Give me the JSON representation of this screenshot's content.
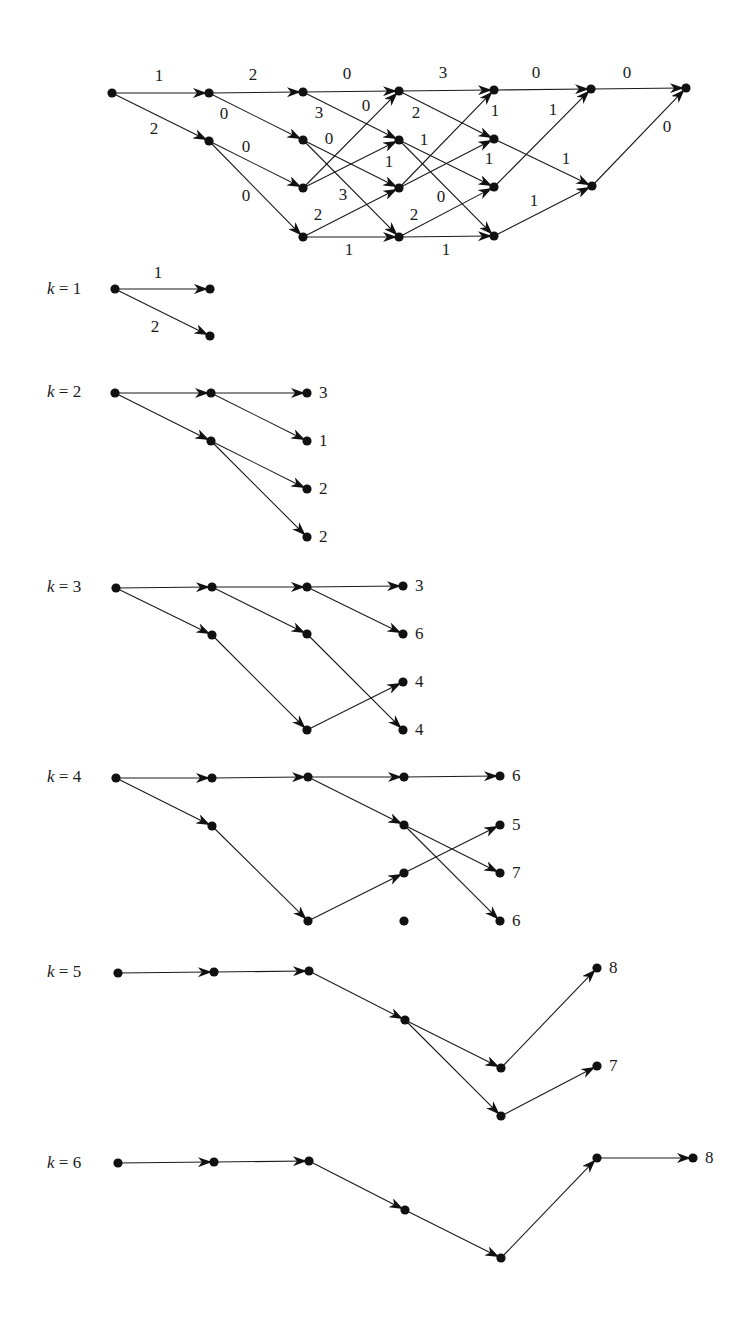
{
  "diagram": {
    "title": "",
    "colors": {
      "ink": "#111111",
      "background": "#ffffff"
    },
    "trellis": {
      "nodes": [
        {
          "id": "s",
          "x": 112,
          "y": 93
        },
        {
          "id": "a1",
          "x": 209,
          "y": 93
        },
        {
          "id": "a2",
          "x": 209,
          "y": 141
        },
        {
          "id": "b1",
          "x": 303,
          "y": 92
        },
        {
          "id": "b2",
          "x": 303,
          "y": 140
        },
        {
          "id": "b3",
          "x": 303,
          "y": 188
        },
        {
          "id": "b4",
          "x": 303,
          "y": 237
        },
        {
          "id": "c1",
          "x": 399,
          "y": 91
        },
        {
          "id": "c2",
          "x": 399,
          "y": 140
        },
        {
          "id": "c3",
          "x": 399,
          "y": 188
        },
        {
          "id": "c4",
          "x": 399,
          "y": 237
        },
        {
          "id": "d1",
          "x": 494,
          "y": 90
        },
        {
          "id": "d2",
          "x": 494,
          "y": 139
        },
        {
          "id": "d3",
          "x": 494,
          "y": 187
        },
        {
          "id": "d4",
          "x": 494,
          "y": 236
        },
        {
          "id": "e1",
          "x": 591,
          "y": 89
        },
        {
          "id": "e2",
          "x": 592,
          "y": 186
        },
        {
          "id": "t",
          "x": 686,
          "y": 88
        }
      ],
      "edges": [
        {
          "from": "s",
          "to": "a1",
          "w": "1",
          "lx": 159,
          "ly": 77
        },
        {
          "from": "s",
          "to": "a2",
          "w": "2",
          "lx": 154,
          "ly": 130
        },
        {
          "from": "a1",
          "to": "b1",
          "w": "2",
          "lx": 253,
          "ly": 76
        },
        {
          "from": "a1",
          "to": "b2",
          "w": "0",
          "lx": 224,
          "ly": 115
        },
        {
          "from": "a2",
          "to": "b3",
          "w": "0",
          "lx": 246,
          "ly": 148
        },
        {
          "from": "a2",
          "to": "b4",
          "w": "0",
          "lx": 246,
          "ly": 197
        },
        {
          "from": "b1",
          "to": "c1",
          "w": "0",
          "lx": 347,
          "ly": 75
        },
        {
          "from": "b1",
          "to": "c2",
          "w": "3",
          "lx": 319,
          "ly": 114
        },
        {
          "from": "b2",
          "to": "c3",
          "w": "0",
          "lx": 329,
          "ly": 140
        },
        {
          "from": "b2",
          "to": "c4",
          "w": "3",
          "lx": 343,
          "ly": 196
        },
        {
          "from": "b3",
          "to": "c1",
          "w": "0",
          "lx": 366,
          "ly": 107
        },
        {
          "from": "b3",
          "to": "c2",
          "w": "1",
          "lx": 389,
          "ly": 163
        },
        {
          "from": "b4",
          "to": "c3",
          "w": "2",
          "lx": 318,
          "ly": 216
        },
        {
          "from": "b4",
          "to": "c4",
          "w": "1",
          "lx": 349,
          "ly": 251
        },
        {
          "from": "c1",
          "to": "d1",
          "w": "3",
          "lx": 443,
          "ly": 74
        },
        {
          "from": "c1",
          "to": "d2",
          "w": "2",
          "lx": 416,
          "ly": 114
        },
        {
          "from": "c2",
          "to": "d3",
          "w": "1",
          "lx": 424,
          "ly": 141
        },
        {
          "from": "c2",
          "to": "d4",
          "w": "0",
          "lx": 441,
          "ly": 198
        },
        {
          "from": "c3",
          "to": "d1",
          "w": "1",
          "lx": 495,
          "ly": 112
        },
        {
          "from": "c3",
          "to": "d2",
          "w": "1",
          "lx": 489,
          "ly": 160
        },
        {
          "from": "c4",
          "to": "d3",
          "w": "2",
          "lx": 414,
          "ly": 216
        },
        {
          "from": "c4",
          "to": "d4",
          "w": "1",
          "lx": 446,
          "ly": 251
        },
        {
          "from": "d1",
          "to": "e1",
          "w": "0",
          "lx": 536,
          "ly": 74
        },
        {
          "from": "d2",
          "to": "e2",
          "w": "1",
          "lx": 566,
          "ly": 160
        },
        {
          "from": "d3",
          "to": "e1",
          "w": "1",
          "lx": 553,
          "ly": 111
        },
        {
          "from": "d4",
          "to": "e2",
          "w": "1",
          "lx": 534,
          "ly": 202
        },
        {
          "from": "e1",
          "to": "t",
          "w": "0",
          "lx": 627,
          "ly": 74
        },
        {
          "from": "e2",
          "to": "t",
          "w": "0",
          "lx": 667,
          "ly": 128
        }
      ]
    },
    "stages": [
      {
        "label_var": "k",
        "label_eq": " = 1",
        "lx": 47,
        "ly": 290,
        "nodes": [
          {
            "id": "n0",
            "x": 115,
            "y": 289
          },
          {
            "id": "n1",
            "x": 210,
            "y": 289
          },
          {
            "id": "n2",
            "x": 210,
            "y": 336
          }
        ],
        "edges": [
          {
            "from": "n0",
            "to": "n1",
            "w": "1",
            "lx": 158,
            "ly": 274
          },
          {
            "from": "n0",
            "to": "n2",
            "w": "2",
            "lx": 155,
            "ly": 328
          }
        ],
        "values": []
      },
      {
        "label_var": "k",
        "label_eq": " = 2",
        "lx": 47,
        "ly": 393,
        "nodes": [
          {
            "id": "n0",
            "x": 115,
            "y": 393
          },
          {
            "id": "n1",
            "x": 211,
            "y": 393
          },
          {
            "id": "n2",
            "x": 211,
            "y": 441
          },
          {
            "id": "e1",
            "x": 307,
            "y": 393
          },
          {
            "id": "e2",
            "x": 307,
            "y": 441
          },
          {
            "id": "e3",
            "x": 307,
            "y": 489
          },
          {
            "id": "e4",
            "x": 307,
            "y": 537
          }
        ],
        "edges": [
          {
            "from": "n0",
            "to": "n1"
          },
          {
            "from": "n0",
            "to": "n2"
          },
          {
            "from": "n1",
            "to": "e1"
          },
          {
            "from": "n1",
            "to": "e2"
          },
          {
            "from": "n2",
            "to": "e3"
          },
          {
            "from": "n2",
            "to": "e4"
          }
        ],
        "values": [
          {
            "node": "e1",
            "v": "3"
          },
          {
            "node": "e2",
            "v": "1"
          },
          {
            "node": "e3",
            "v": "2"
          },
          {
            "node": "e4",
            "v": "2"
          }
        ]
      },
      {
        "label_var": "k",
        "label_eq": " = 3",
        "lx": 47,
        "ly": 588,
        "nodes": [
          {
            "id": "n0",
            "x": 116,
            "y": 588
          },
          {
            "id": "n1",
            "x": 212,
            "y": 587
          },
          {
            "id": "n2",
            "x": 212,
            "y": 635
          },
          {
            "id": "m1",
            "x": 307,
            "y": 587
          },
          {
            "id": "m2",
            "x": 307,
            "y": 634
          },
          {
            "id": "m3",
            "x": 307,
            "y": 730
          },
          {
            "id": "e1",
            "x": 403,
            "y": 586
          },
          {
            "id": "e2",
            "x": 403,
            "y": 634
          },
          {
            "id": "e3",
            "x": 403,
            "y": 682
          },
          {
            "id": "e4",
            "x": 403,
            "y": 730
          }
        ],
        "edges": [
          {
            "from": "n0",
            "to": "n1"
          },
          {
            "from": "n0",
            "to": "n2"
          },
          {
            "from": "n1",
            "to": "m1"
          },
          {
            "from": "n1",
            "to": "m2"
          },
          {
            "from": "n2",
            "to": "m3"
          },
          {
            "from": "m1",
            "to": "e1"
          },
          {
            "from": "m1",
            "to": "e2"
          },
          {
            "from": "m3",
            "to": "e3"
          },
          {
            "from": "m2",
            "to": "e4"
          }
        ],
        "values": [
          {
            "node": "e1",
            "v": "3"
          },
          {
            "node": "e2",
            "v": "6"
          },
          {
            "node": "e3",
            "v": "4"
          },
          {
            "node": "e4",
            "v": "4"
          }
        ]
      },
      {
        "label_var": "k",
        "label_eq": " = 4",
        "lx": 47,
        "ly": 778,
        "nodes": [
          {
            "id": "n0",
            "x": 116,
            "y": 778
          },
          {
            "id": "n1",
            "x": 212,
            "y": 778
          },
          {
            "id": "n2",
            "x": 212,
            "y": 826
          },
          {
            "id": "m1",
            "x": 308,
            "y": 777
          },
          {
            "id": "m3",
            "x": 308,
            "y": 921
          },
          {
            "id": "p1",
            "x": 404,
            "y": 777
          },
          {
            "id": "p2",
            "x": 404,
            "y": 825
          },
          {
            "id": "p3",
            "x": 404,
            "y": 873
          },
          {
            "id": "p4",
            "x": 404,
            "y": 921
          },
          {
            "id": "e1",
            "x": 500,
            "y": 776
          },
          {
            "id": "e2",
            "x": 500,
            "y": 825
          },
          {
            "id": "e3",
            "x": 500,
            "y": 873
          },
          {
            "id": "e4",
            "x": 500,
            "y": 921
          }
        ],
        "edges": [
          {
            "from": "n0",
            "to": "n1"
          },
          {
            "from": "n0",
            "to": "n2"
          },
          {
            "from": "n1",
            "to": "m1"
          },
          {
            "from": "n2",
            "to": "m3"
          },
          {
            "from": "m1",
            "to": "p1"
          },
          {
            "from": "m1",
            "to": "p2"
          },
          {
            "from": "m3",
            "to": "p3"
          },
          {
            "from": "p1",
            "to": "e1"
          },
          {
            "from": "p3",
            "to": "e2"
          },
          {
            "from": "p2",
            "to": "e3"
          },
          {
            "from": "p2",
            "to": "e4"
          }
        ],
        "values": [
          {
            "node": "e1",
            "v": "6"
          },
          {
            "node": "e2",
            "v": "5"
          },
          {
            "node": "e3",
            "v": "7"
          },
          {
            "node": "e4",
            "v": "6"
          }
        ]
      },
      {
        "label_var": "k",
        "label_eq": " = 5",
        "lx": 47,
        "ly": 973,
        "nodes": [
          {
            "id": "n0",
            "x": 118,
            "y": 973
          },
          {
            "id": "n1",
            "x": 214,
            "y": 972
          },
          {
            "id": "m1",
            "x": 309,
            "y": 971
          },
          {
            "id": "p1",
            "x": 405,
            "y": 1020
          },
          {
            "id": "q1",
            "x": 501,
            "y": 1068
          },
          {
            "id": "q2",
            "x": 501,
            "y": 1116
          },
          {
            "id": "e1",
            "x": 597,
            "y": 968
          },
          {
            "id": "e2",
            "x": 597,
            "y": 1066
          }
        ],
        "edges": [
          {
            "from": "n0",
            "to": "n1"
          },
          {
            "from": "n1",
            "to": "m1"
          },
          {
            "from": "m1",
            "to": "p1"
          },
          {
            "from": "p1",
            "to": "q1"
          },
          {
            "from": "p1",
            "to": "q2"
          },
          {
            "from": "q1",
            "to": "e1"
          },
          {
            "from": "q2",
            "to": "e2"
          }
        ],
        "values": [
          {
            "node": "e1",
            "v": "8"
          },
          {
            "node": "e2",
            "v": "7"
          }
        ]
      },
      {
        "label_var": "k",
        "label_eq": " = 6",
        "lx": 47,
        "ly": 1164,
        "nodes": [
          {
            "id": "n0",
            "x": 118,
            "y": 1163
          },
          {
            "id": "n1",
            "x": 214,
            "y": 1162
          },
          {
            "id": "m1",
            "x": 309,
            "y": 1161
          },
          {
            "id": "p1",
            "x": 405,
            "y": 1210
          },
          {
            "id": "q1",
            "x": 501,
            "y": 1258
          },
          {
            "id": "r1",
            "x": 597,
            "y": 1158
          },
          {
            "id": "e1",
            "x": 693,
            "y": 1158
          }
        ],
        "edges": [
          {
            "from": "n0",
            "to": "n1"
          },
          {
            "from": "n1",
            "to": "m1"
          },
          {
            "from": "m1",
            "to": "p1"
          },
          {
            "from": "p1",
            "to": "q1"
          },
          {
            "from": "q1",
            "to": "r1"
          },
          {
            "from": "r1",
            "to": "e1"
          }
        ],
        "values": [
          {
            "node": "e1",
            "v": "8"
          }
        ]
      }
    ]
  }
}
